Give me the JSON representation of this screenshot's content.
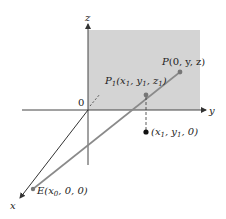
{
  "diagram": {
    "axes": {
      "x_label": "x",
      "y_label": "y",
      "z_label": "z",
      "origin_label": "0"
    },
    "points": {
      "P": {
        "name": "P",
        "coords": "(0, y, z)"
      },
      "P1": {
        "name": "P",
        "sub": "1",
        "coords_open": "(x",
        "c1sub": "1",
        "mid": ", y",
        "c2sub": "1",
        "mid2": ", z",
        "c3sub": "1",
        "close": ")"
      },
      "E": {
        "name": "E",
        "coords_open": "(x",
        "c1sub": "0",
        "close": ", 0, 0)"
      },
      "projection": {
        "coords_open": "(x",
        "c1sub": "1",
        "mid": ", y",
        "c2sub": "1",
        "close": ", 0)"
      }
    },
    "colors": {
      "plane_fill": "#d4d4d4",
      "axis": "#333333",
      "ray": "#8a8a8a",
      "point": "#111111"
    }
  }
}
